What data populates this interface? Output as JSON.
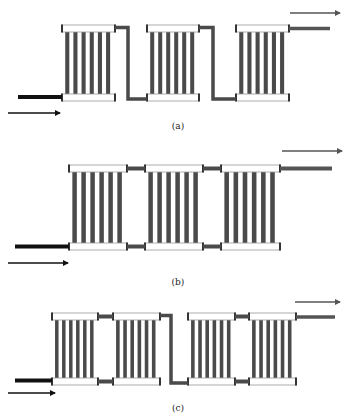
{
  "colors": {
    "tube": "#4a4a4a",
    "header_fill": "#ffffff",
    "header_stroke": "#9a9a9a",
    "header_cap": "#333333",
    "inlet_pipe": "#111111",
    "connector": "#4a4a4a",
    "outlet_pipe": "#555555",
    "arrow_in": "#111111",
    "arrow_out": "#555555"
  },
  "panels": [
    {
      "id": "a",
      "caption": "(a)",
      "caption_pos": [
        178,
        129
      ],
      "top_y": 25,
      "bottom_y": 94,
      "header_h": 7,
      "tubes_per_radiator": 6,
      "radiators": [
        {
          "x": 62,
          "w": 53
        },
        {
          "x": 147,
          "w": 52
        },
        {
          "x": 236,
          "w": 53
        }
      ],
      "connections": [
        {
          "type": "series",
          "from": 0,
          "to": 1,
          "drop_x": 128
        },
        {
          "type": "series",
          "from": 1,
          "to": 2,
          "drop_x": 213
        }
      ],
      "inlet": {
        "x1": 18,
        "x2": 62,
        "y": 97,
        "w": 4
      },
      "inlet_arrow": {
        "x1": 8,
        "x2": 60,
        "y": 113
      },
      "outlet": {
        "x1": 289,
        "x2": 330,
        "y": 28.5,
        "w": 3.5
      },
      "outlet_arrow": {
        "x1": 290,
        "x2": 340,
        "y": 13
      }
    },
    {
      "id": "b",
      "caption": "(b)",
      "caption_pos": [
        178,
        285
      ],
      "top_y": 165,
      "bottom_y": 243,
      "header_h": 7,
      "tubes_per_radiator": 6,
      "radiators": [
        {
          "x": 69,
          "w": 58
        },
        {
          "x": 145,
          "w": 58
        },
        {
          "x": 221,
          "w": 59
        }
      ],
      "connections": [
        {
          "type": "parallel",
          "from": 0,
          "to": 1
        },
        {
          "type": "parallel",
          "from": 1,
          "to": 2
        }
      ],
      "inlet": {
        "x1": 15,
        "x2": 69,
        "y": 246.5,
        "w": 4
      },
      "inlet_arrow": {
        "x1": 8,
        "x2": 68,
        "y": 263
      },
      "outlet": {
        "x1": 280,
        "x2": 332,
        "y": 168.5,
        "w": 4
      },
      "outlet_arrow": {
        "x1": 282,
        "x2": 342,
        "y": 151
      }
    },
    {
      "id": "c",
      "caption": "(c)",
      "caption_pos": [
        178,
        411
      ],
      "top_y": 313,
      "bottom_y": 378,
      "header_h": 7,
      "tubes_per_radiator": 6,
      "radiators": [
        {
          "x": 52,
          "w": 46
        },
        {
          "x": 113,
          "w": 47
        },
        {
          "x": 188,
          "w": 47
        },
        {
          "x": 249,
          "w": 47
        }
      ],
      "connections": [
        {
          "type": "parallel",
          "from": 0,
          "to": 1
        },
        {
          "type": "series",
          "from": 1,
          "to": 2,
          "drop_x": 171
        },
        {
          "type": "parallel",
          "from": 2,
          "to": 3
        }
      ],
      "inlet": {
        "x1": 15,
        "x2": 52,
        "y": 380.5,
        "w": 4
      },
      "inlet_arrow": {
        "x1": 8,
        "x2": 55,
        "y": 393
      },
      "outlet": {
        "x1": 296,
        "x2": 335,
        "y": 317,
        "w": 3.5
      },
      "outlet_arrow": {
        "x1": 295,
        "x2": 340,
        "y": 302
      }
    }
  ]
}
